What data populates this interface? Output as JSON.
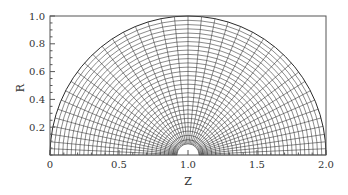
{
  "chart_data": {
    "type": "mesh",
    "title": "",
    "xlabel": "Z",
    "ylabel": "R",
    "xlim": [
      0,
      2.0
    ],
    "ylim": [
      0,
      1.0
    ],
    "x_ticks": [
      "0",
      "0.5",
      "1.0",
      "1.5",
      "2.0"
    ],
    "x_tick_values": [
      0,
      0.5,
      1.0,
      1.5,
      2.0
    ],
    "y_ticks": [
      "0.2",
      "0.4",
      "0.6",
      "0.8",
      "1.0"
    ],
    "y_tick_values": [
      0.2,
      0.4,
      0.6,
      0.8,
      1.0
    ],
    "x_minor_step": 0.1,
    "y_minor_step": 0.05,
    "grid": false,
    "legend": null,
    "mesh": {
      "description": "Semi-annular polar computational grid centered at (Z=1, R=0)",
      "center": [
        1.0,
        0.0
      ],
      "inner_radius": 0.08,
      "outer_radius": 1.0,
      "radial_lines": 41,
      "circumferential_rings": 31,
      "angular_clustering": "clustered toward theta=0 and theta=180 deg"
    }
  },
  "colors": {
    "mesh": "#2a2a2a",
    "frame": "#555555",
    "text": "#333333"
  }
}
